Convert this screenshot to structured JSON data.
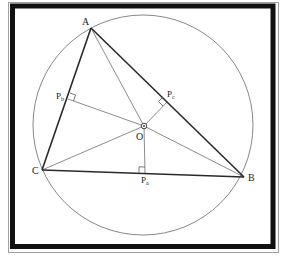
{
  "figure": {
    "colors": {
      "frame": "#111111",
      "frame_outer": "#9a9a9a",
      "triangle_side": "#2a2a2a",
      "construction_line": "#6e6e6e",
      "circle": "#7a7a7a",
      "background": "#ffffff"
    }
  },
  "points": {
    "A": {
      "label": "A"
    },
    "B": {
      "label": "B"
    },
    "C": {
      "label": "C"
    },
    "O": {
      "label": "O"
    },
    "Pa": {
      "label": "P",
      "subscript": "a"
    },
    "Pb": {
      "label": "P",
      "subscript": "b"
    },
    "Pc": {
      "label": "P",
      "subscript": "c"
    }
  },
  "elements": {
    "triangle": [
      "A",
      "B",
      "C"
    ],
    "circumcircle_center": "O",
    "segments_to_center": [
      "OA",
      "OB",
      "OC"
    ],
    "perpendiculars": [
      {
        "from": "O",
        "foot": "Pa",
        "side": "BC"
      },
      {
        "from": "O",
        "foot": "Pb",
        "side": "CA"
      },
      {
        "from": "O",
        "foot": "Pc",
        "side": "AB"
      }
    ]
  }
}
